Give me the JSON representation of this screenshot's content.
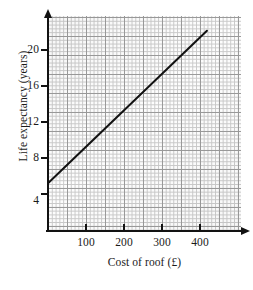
{
  "chart_data": {
    "type": "line",
    "title": "",
    "xlabel": "Cost of roof (£)",
    "ylabel": "Life expectancy (years)",
    "x_ticks": [
      100,
      200,
      300,
      400
    ],
    "x_tick_labels": [
      "100",
      "200",
      "300",
      "400"
    ],
    "y_ticks": [
      4,
      8,
      12,
      16,
      20
    ],
    "y_tick_labels": [
      "4",
      "8",
      "12",
      "16",
      "20"
    ],
    "xlim": [
      0,
      510
    ],
    "ylim": [
      0,
      23.4
    ],
    "grid": true,
    "grid_style": "graph-paper, minor every 10 units (x) / 0.4 years (y), major every 50 units (x) / 2 years (y)",
    "legend": "none",
    "series": [
      {
        "name": "Line of best fit",
        "points": [
          {
            "x": 0,
            "y": 5.2
          },
          {
            "x": 420,
            "y": 21.8
          }
        ],
        "color": "#121212",
        "linewidth": 2.0
      }
    ],
    "annotations": []
  },
  "axes": {
    "y_axis_name": "y-axis",
    "x_axis_name": "x-axis",
    "arrow_y_name": "y-axis-arrow",
    "arrow_x_name": "x-axis-arrow"
  },
  "colors": {
    "background": "#ffffff",
    "grid_minor": "#c9c9c9",
    "grid_major": "#9a9a9a",
    "axis": "#121212",
    "data_line": "#121212",
    "text": "#1a1a1a"
  }
}
